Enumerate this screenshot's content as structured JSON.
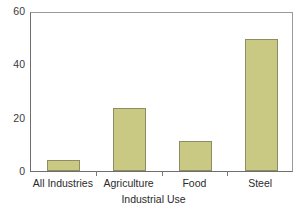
{
  "chart_data": {
    "type": "bar",
    "title": "",
    "subtitle": "",
    "xlabel": "Industrial Use",
    "ylabel": "",
    "categories": [
      "All Industries",
      "Agriculture",
      "Food",
      "Steel"
    ],
    "values": [
      4,
      23.6,
      11.2,
      49.5
    ],
    "series": [
      {
        "name": "",
        "values": [
          4,
          23.6,
          11.2,
          49.5
        ]
      }
    ],
    "ylim": [
      0,
      60
    ],
    "yticks": [
      0,
      20,
      40,
      60
    ],
    "ytick_labels": [
      "0",
      "20",
      "40",
      "60"
    ],
    "grid": false,
    "legend": false,
    "legend_position": "none",
    "bar_fill_color": "#c9c983",
    "bar_edge_color": "#8d8d63",
    "axis_color": "#6e6e6e",
    "background_color": "#ffffff",
    "text_color": "#2b2b2b",
    "annotations": []
  }
}
